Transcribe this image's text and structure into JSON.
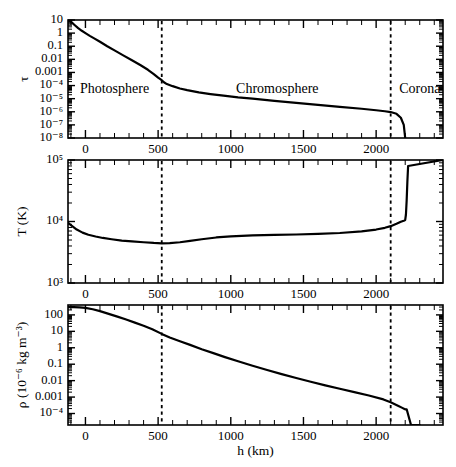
{
  "figure": {
    "xlabel": "h (km)",
    "xticklabels": [
      "0",
      "500",
      "1000",
      "1500",
      "2000"
    ],
    "xtickvalues": [
      0,
      500,
      1000,
      1500,
      2000
    ],
    "xlim": [
      -120,
      2460
    ],
    "regions": [
      {
        "name": "photosphere",
        "label": "Photosphere",
        "center": 200
      },
      {
        "name": "chromosphere",
        "label": "Chromosphere",
        "center": 1320
      },
      {
        "name": "corona",
        "label": "Corona",
        "center": 2300
      }
    ],
    "boundaries": [
      525,
      2100
    ]
  },
  "chart_data": [
    {
      "type": "line",
      "name": "optical-depth",
      "title": "",
      "xlabel": "h (km)",
      "ylabel": "τ",
      "ylabel_parts": {
        "base": "τ"
      },
      "xlim": [
        -120,
        2460
      ],
      "ylim": [
        1e-08,
        10
      ],
      "yscale": "log",
      "grid": false,
      "yticklabels": [
        "10",
        "1",
        "0.1",
        "0.01",
        "0.001",
        "10⁻⁴",
        "10⁻⁵",
        "10⁻⁶",
        "10⁻⁷",
        "10⁻⁸"
      ],
      "ytickvalues": [
        10,
        1,
        0.1,
        0.01,
        0.001,
        0.0001,
        1e-05,
        1e-06,
        1e-07,
        1e-08
      ],
      "x": [
        -120,
        -100,
        -75,
        -50,
        -25,
        0,
        30,
        60,
        100,
        150,
        200,
        260,
        320,
        380,
        430,
        470,
        500,
        520,
        540,
        560,
        600,
        650,
        700,
        780,
        860,
        950,
        1050,
        1150,
        1300,
        1450,
        1600,
        1750,
        1900,
        2000,
        2060,
        2100,
        2140,
        2170,
        2190,
        2200
      ],
      "y": [
        10,
        7.5,
        4.2,
        2.4,
        1.5,
        1.0,
        0.62,
        0.4,
        0.22,
        0.1,
        0.048,
        0.02,
        0.0085,
        0.0035,
        0.0016,
        0.00075,
        0.0004,
        0.00028,
        0.00018,
        0.00013,
        9e-05,
        6e-05,
        4.5e-05,
        3e-05,
        2.25e-05,
        1.7e-05,
        1.25e-05,
        1e-05,
        6.8e-06,
        4.8e-06,
        3.4e-06,
        2.4e-06,
        1.7e-06,
        1.3e-06,
        1.1e-06,
        9.5e-07,
        7e-07,
        3.5e-07,
        1e-07,
        1e-08
      ]
    },
    {
      "type": "line",
      "name": "temperature",
      "title": "",
      "xlabel": "h (km)",
      "ylabel": "T (K)",
      "xlim": [
        -120,
        2460
      ],
      "ylim": [
        1000,
        100000
      ],
      "yscale": "log",
      "grid": false,
      "yticklabels": [
        "10⁵",
        "10⁴",
        "10³"
      ],
      "ytickvalues": [
        100000,
        10000,
        1000
      ],
      "x": [
        -120,
        -100,
        -60,
        -20,
        20,
        70,
        120,
        180,
        250,
        320,
        400,
        470,
        525,
        580,
        650,
        720,
        800,
        900,
        1000,
        1150,
        1300,
        1450,
        1600,
        1750,
        1900,
        2000,
        2060,
        2100,
        2140,
        2170,
        2190,
        2200,
        2205,
        2210,
        2215,
        2220,
        2460
      ],
      "y": [
        9600,
        8700,
        7400,
        6600,
        6100,
        5700,
        5400,
        5150,
        4900,
        4750,
        4600,
        4480,
        4420,
        4450,
        4600,
        4850,
        5150,
        5500,
        5750,
        5950,
        6050,
        6150,
        6300,
        6500,
        6900,
        7400,
        7900,
        8400,
        9200,
        9900,
        10300,
        10600,
        13000,
        22000,
        45000,
        80000,
        100000
      ]
    },
    {
      "type": "line",
      "name": "density",
      "title": "",
      "xlabel": "h (km)",
      "ylabel": "ρ (10⁻⁶ kg m⁻³)",
      "xlim": [
        -120,
        2460
      ],
      "ylim": [
        2e-05,
        400
      ],
      "yscale": "log",
      "grid": false,
      "yticklabels": [
        "100",
        "10",
        "1",
        "0.1",
        "0.01",
        "0.001",
        "10⁻⁴"
      ],
      "ytickvalues": [
        100,
        10,
        1,
        0.1,
        0.01,
        0.001,
        0.0001
      ],
      "x": [
        -120,
        -80,
        -40,
        0,
        50,
        100,
        160,
        220,
        280,
        340,
        400,
        460,
        525,
        580,
        650,
        720,
        800,
        880,
        960,
        1050,
        1150,
        1250,
        1350,
        1450,
        1550,
        1650,
        1750,
        1850,
        1950,
        2050,
        2100,
        2150,
        2180,
        2195,
        2200,
        2205,
        2210,
        2240,
        2300
      ],
      "y": [
        300,
        300,
        290,
        270,
        220,
        170,
        115,
        78,
        52,
        34,
        22,
        13.5,
        7.0,
        4.2,
        2.5,
        1.5,
        0.82,
        0.47,
        0.27,
        0.15,
        0.08,
        0.044,
        0.025,
        0.0145,
        0.0086,
        0.0052,
        0.0032,
        0.002,
        0.00125,
        0.00072,
        0.00048,
        0.0003,
        0.00022,
        0.00019,
        0.00018,
        0.00018,
        0.00018,
        2e-05,
        2e-05
      ]
    }
  ]
}
